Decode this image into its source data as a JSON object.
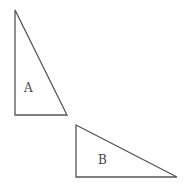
{
  "diagram": {
    "stroke_color": "#555555",
    "triangles": [
      {
        "label": "A",
        "points": "15,10 15,115 67,115",
        "label_pos": [
          24,
          92
        ]
      },
      {
        "label": "B",
        "points": "76,125 76,177 177,177",
        "label_pos": [
          98,
          164
        ]
      }
    ]
  }
}
